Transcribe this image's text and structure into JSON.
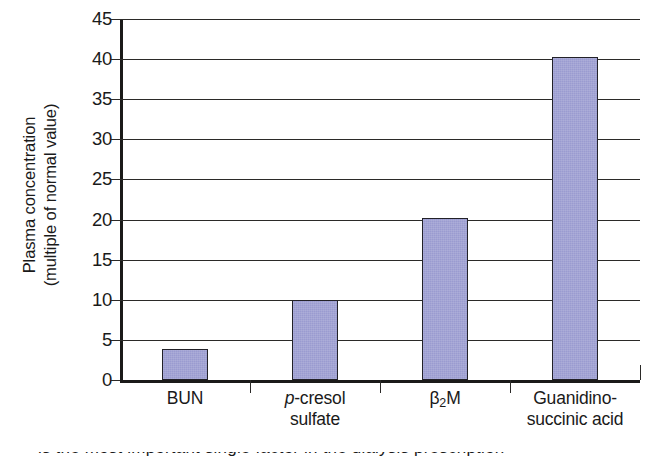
{
  "chart_data": {
    "type": "bar",
    "title": "",
    "xlabel": "",
    "ylabel": "Plasma concentration (multiple of normal value)",
    "ylabel_line1": "Plasma concentration",
    "ylabel_line2": "(multiple of normal value)",
    "categories": [
      "BUN",
      "p-cresol sulfate",
      "β2M",
      "Guanidinosuccinic acid"
    ],
    "values": [
      3.9,
      10.0,
      20.2,
      40.3
    ],
    "ylim": [
      0,
      45
    ],
    "ytick_step": 5,
    "yticks": [
      0,
      5,
      10,
      15,
      20,
      25,
      30,
      35,
      40,
      45
    ],
    "ytick_labels": [
      "0",
      "5",
      "10",
      "15",
      "20",
      "25",
      "30",
      "35",
      "40",
      "45"
    ],
    "grid": "horizontal",
    "legend": "none",
    "bar_color": "#9a9bd0",
    "bar_edge_color": "#222128",
    "axis_color": "#1b1a19",
    "background": "#ffffff",
    "bars": [
      {
        "label": "BUN",
        "label_line1": "BUN",
        "label_line2": "",
        "value": 3.9
      },
      {
        "label": "p-cresol sulfate",
        "label_line1_italic": "p",
        "label_line1_rest": "-cresol",
        "label_line2": "sulfate",
        "value": 10.0
      },
      {
        "label": "β2M",
        "label_line1_pre": "β",
        "label_line1_sub": "2",
        "label_line1_post": "M",
        "label_line2": "",
        "value": 20.2
      },
      {
        "label": "Guanidinosuccinic acid",
        "label_line1": "Guanidino-",
        "label_line2": "succinic acid",
        "value": 40.3
      }
    ]
  },
  "caption": {
    "cut_off_text": "partially visible cut-off caption line"
  }
}
